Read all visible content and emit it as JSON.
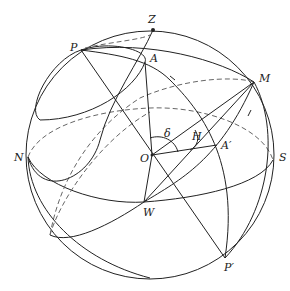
{
  "diagram": {
    "type": "celestial-sphere",
    "colors": {
      "line": "#222222",
      "dashed": "#666666",
      "background": "#ffffff"
    },
    "points": {
      "Z": "Z",
      "P": "P",
      "A": "A",
      "M": "M",
      "N": "N",
      "S": "S",
      "O": "O",
      "A_prime": "A′",
      "W": "W",
      "P_prime": "P′",
      "H": "H",
      "delta": "δ"
    }
  }
}
